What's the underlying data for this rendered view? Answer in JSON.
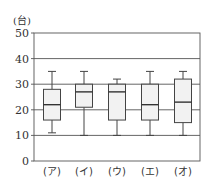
{
  "chart_data": {
    "type": "boxplot",
    "title": "",
    "ylabel": "(台)",
    "xlabel": "",
    "ylim": [
      0,
      50
    ],
    "yticks": [
      0,
      10,
      20,
      30,
      40,
      50
    ],
    "grid": true,
    "categories": [
      "(ア)",
      "(イ)",
      "(ウ)",
      "(エ)",
      "(オ)"
    ],
    "boxes": [
      {
        "label": "(ア)",
        "min": 11,
        "q1": 16,
        "median": 22,
        "q3": 28,
        "max": 35
      },
      {
        "label": "(イ)",
        "min": 10,
        "q1": 21,
        "median": 27,
        "q3": 30,
        "max": 35
      },
      {
        "label": "(ウ)",
        "min": 10,
        "q1": 16,
        "median": 27,
        "q3": 30,
        "max": 32
      },
      {
        "label": "(エ)",
        "min": 10,
        "q1": 16,
        "median": 22,
        "q3": 30,
        "max": 35
      },
      {
        "label": "(オ)",
        "min": 10,
        "q1": 15,
        "median": 23,
        "q3": 32,
        "max": 35
      }
    ],
    "colors": {
      "box_fill": "#f2f2f2",
      "line": "#444444",
      "grid": "#555555"
    }
  }
}
